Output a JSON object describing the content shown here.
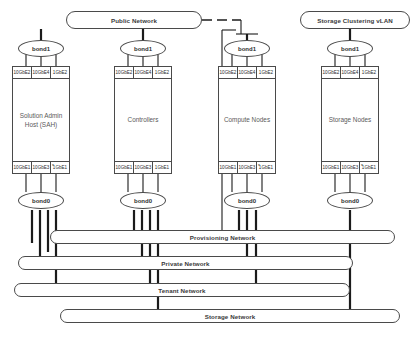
{
  "diagram": {
    "top_networks": [
      {
        "id": "public-network",
        "label": "Public Network"
      },
      {
        "id": "storage-clustering-vlan",
        "label": "Storage Clustering vLAN"
      }
    ],
    "bottom_networks": [
      {
        "id": "provisioning-network",
        "label": "Provisioning Network"
      },
      {
        "id": "private-network",
        "label": "Private Network"
      },
      {
        "id": "tenant-network",
        "label": "Tenant Network"
      },
      {
        "id": "storage-network",
        "label": "Storage Network"
      }
    ],
    "nodes": [
      {
        "id": "solution-admin-host",
        "label": "Solution Admin\nHost (SAH)",
        "label_line1": "Solution Admin",
        "label_line2": "Host (SAH)",
        "bond_top": "bond1",
        "bond_bottom": "bond0",
        "ports_top": [
          "10GbE2",
          "10GbE4",
          "1GbE2"
        ],
        "ports_bottom": [
          "10GbE1",
          "10GbE3",
          "1GbE1"
        ],
        "bottom_footnote_marker": "*"
      },
      {
        "id": "controllers",
        "label": "Controllers",
        "label_line1": "Controllers",
        "label_line2": "",
        "bond_top": "bond1",
        "bond_bottom": "bond0",
        "ports_top": [
          "10GbE2",
          "10GbE4",
          "1GbE2"
        ],
        "ports_bottom": [
          "10GbE1",
          "10GbE3",
          "1GbE1"
        ],
        "bottom_footnote_marker": ""
      },
      {
        "id": "compute-nodes",
        "label": "Compute Nodes",
        "label_line1": "Compute Nodes",
        "label_line2": "",
        "bond_top": "bond1",
        "bond_bottom": "bond0",
        "ports_top": [
          "10GbE2",
          "10GbE4",
          "1GbE2"
        ],
        "ports_bottom": [
          "10GbE1",
          "10GbE3",
          "1GbE1"
        ],
        "bottom_footnote_marker": "*"
      },
      {
        "id": "storage-nodes",
        "label": "Storage Nodes",
        "label_line1": "Storage Nodes",
        "label_line2": "",
        "bond_top": "bond1",
        "bond_bottom": "bond0",
        "ports_top": [
          "10GbE2",
          "10GbE4",
          "1GbE2"
        ],
        "ports_bottom": [
          "10GbE1",
          "10GbE3",
          "1GbE1"
        ],
        "bottom_footnote_marker": "*"
      }
    ],
    "colors": {
      "stroke": "#4a4a4a",
      "stroke_heavy": "#1b1b1b",
      "background": "#ffffff",
      "text": "#5a5a5a"
    }
  }
}
